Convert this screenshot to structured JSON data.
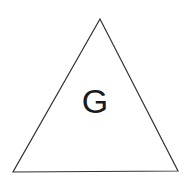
{
  "figure": {
    "type": "geometric-shape-diagram",
    "background_color": "#ffffff",
    "width": 191,
    "height": 186,
    "shape": {
      "name": "triangle",
      "kind": "isosceles-triangle",
      "fill": "none",
      "stroke_color": "#333333",
      "stroke_width": 1.2,
      "points": "100,19 178,171 13,172",
      "vertices": [
        {
          "label": "apex",
          "x": 100,
          "y": 19
        },
        {
          "label": "bottom-right",
          "x": 178,
          "y": 171
        },
        {
          "label": "bottom-left",
          "x": 13,
          "y": 172
        }
      ]
    },
    "label": {
      "text": "G",
      "color": "#1a1a1a",
      "font_size": 34,
      "x": 95,
      "y": 113
    }
  }
}
